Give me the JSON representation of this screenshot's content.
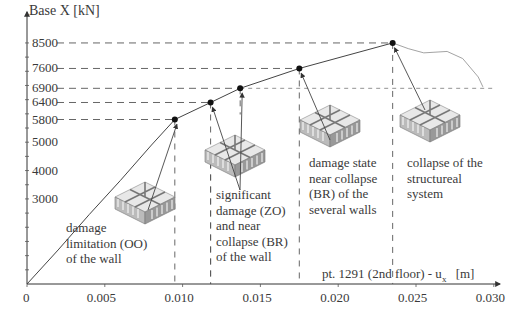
{
  "chart_data": {
    "type": "line",
    "title": "",
    "ylabel": "Base X [kN]",
    "xlabel": "pt. 1291 (2nd floor) - u_x [m]",
    "xlabel_parts": {
      "main": "pt. 1291 (2nd floor) - u",
      "sub": "x",
      "unit": "[m]"
    },
    "x_ticks": [
      "0",
      "0.005",
      "0.010",
      "0.015",
      "0.020",
      "0.025",
      "0.030"
    ],
    "x_tick_values": [
      0,
      0.005,
      0.01,
      0.015,
      0.02,
      0.025,
      0.03
    ],
    "y_ticks": [
      "3000",
      "4000",
      "5000",
      "5800",
      "6400",
      "6900",
      "7600",
      "8500"
    ],
    "y_tick_values": [
      3000,
      4000,
      5000,
      5800,
      6400,
      6900,
      7600,
      8500
    ],
    "xlim": [
      0,
      0.03
    ],
    "ylim": [
      0,
      8800
    ],
    "grid": false,
    "series": [
      {
        "name": "capacity curve",
        "x": [
          0,
          0.002,
          0.004,
          0.006,
          0.008,
          0.0095,
          0.0118,
          0.0137,
          0.0175,
          0.0205,
          0.0235,
          0.0245,
          0.0255,
          0.027,
          0.028,
          0.029,
          0.0293
        ],
        "y": [
          0,
          1200,
          2450,
          3650,
          4900,
          5800,
          6400,
          6900,
          7600,
          8050,
          8500,
          8300,
          8150,
          8200,
          7950,
          7300,
          6950
        ]
      }
    ],
    "key_points": [
      {
        "x": 0.0095,
        "y": 5800,
        "label": "damage limitation (OO) of the wall"
      },
      {
        "x": 0.0118,
        "y": 6400,
        "label": "significant damage (ZO) and near collapse (BR) of the wall"
      },
      {
        "x": 0.0137,
        "y": 6900,
        "label": "significant damage (ZO) and near collapse (BR) of the wall"
      },
      {
        "x": 0.0175,
        "y": 7600,
        "label": "damage state near collapse (BR) of the several walls"
      },
      {
        "x": 0.0235,
        "y": 8500,
        "label": "collapse of the structureal system"
      }
    ],
    "annotations": [
      {
        "lines": [
          "damage",
          "limitation (OO)",
          "of the wall"
        ]
      },
      {
        "lines": [
          "significant",
          "damage (ZO)",
          "and near",
          "collapse (BR)",
          "of the wall"
        ]
      },
      {
        "lines": [
          "damage state",
          "near collapse",
          "(BR) of the",
          "several walls"
        ]
      },
      {
        "lines": [
          "collapse of the",
          "structureal",
          "system"
        ]
      }
    ]
  }
}
